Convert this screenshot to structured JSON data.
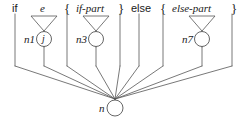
{
  "figure": {
    "kind": "syntax-tree-diagram",
    "stroke_color": "#555555",
    "text_color": "#1a1a1a",
    "background": "#ffffff"
  },
  "top_labels": [
    {
      "id": "if-keyword",
      "text": "if",
      "style": "roman",
      "x": 12,
      "y": 3
    },
    {
      "id": "e-nonterminal",
      "text": "e",
      "style": "italic",
      "x": 40,
      "y": 3
    },
    {
      "id": "brace-open-1",
      "text": "{",
      "style": "roman",
      "x": 64,
      "y": 2
    },
    {
      "id": "if-part",
      "text": "if-part",
      "style": "italic",
      "x": 76,
      "y": 3
    },
    {
      "id": "brace-close-1",
      "text": "}",
      "style": "roman",
      "x": 118,
      "y": 2
    },
    {
      "id": "else-keyword",
      "text": "else",
      "style": "roman",
      "x": 131,
      "y": 3
    },
    {
      "id": "brace-open-2",
      "text": "{",
      "style": "roman",
      "x": 160,
      "y": 2
    },
    {
      "id": "else-part",
      "text": "else-part",
      "style": "italic",
      "x": 172,
      "y": 3
    },
    {
      "id": "brace-close-2",
      "text": "}",
      "style": "roman",
      "x": 231,
      "y": 2
    }
  ],
  "triangles": [
    {
      "id": "triangle-e",
      "cx": 44,
      "top": 16,
      "half_width": 13,
      "apex_y": 31
    },
    {
      "id": "triangle-if-part",
      "cx": 96,
      "top": 16,
      "half_width": 13,
      "apex_y": 31
    },
    {
      "id": "triangle-else-part",
      "cx": 202,
      "top": 16,
      "half_width": 13,
      "apex_y": 31
    }
  ],
  "nodes": [
    {
      "id": "n1",
      "label": "n1",
      "inner": "j",
      "cx": 44,
      "cy": 39,
      "r": 7.5,
      "label_x": 24,
      "label_y": 34
    },
    {
      "id": "n3",
      "label": "n3",
      "inner": "",
      "cx": 96,
      "cy": 39,
      "r": 7.5,
      "label_x": 76,
      "label_y": 34
    },
    {
      "id": "n7",
      "label": "n7",
      "inner": "",
      "cx": 202,
      "cy": 39,
      "r": 7.5,
      "label_x": 182,
      "label_y": 34
    },
    {
      "id": "n",
      "label": "n",
      "inner": "",
      "cx": 115,
      "cy": 108,
      "r": 8,
      "label_x": 99,
      "label_y": 103
    }
  ],
  "junction": {
    "id": "merge-point",
    "x": 115,
    "y": 99
  },
  "vertical_drops": [
    {
      "id": "drop-if",
      "x": 15,
      "from": 14,
      "to": 66
    },
    {
      "id": "drop-e",
      "x": 44,
      "from": 47,
      "to": 66
    },
    {
      "id": "drop-brace-1",
      "x": 67,
      "from": 14,
      "to": 66
    },
    {
      "id": "drop-if-part",
      "x": 96,
      "from": 47,
      "to": 66
    },
    {
      "id": "drop-brace-2",
      "x": 120,
      "from": 14,
      "to": 66
    },
    {
      "id": "drop-else",
      "x": 139,
      "from": 14,
      "to": 66
    },
    {
      "id": "drop-brace-3",
      "x": 163,
      "from": 14,
      "to": 66
    },
    {
      "id": "drop-else-part",
      "x": 202,
      "from": 47,
      "to": 66
    },
    {
      "id": "drop-brace-4",
      "x": 232,
      "from": 14,
      "to": 66
    }
  ],
  "stems": [
    {
      "id": "stem-n1",
      "x": 44,
      "from": 31,
      "to": 47
    },
    {
      "id": "stem-n3",
      "x": 96,
      "from": 31,
      "to": 47
    },
    {
      "id": "stem-n7",
      "x": 202,
      "from": 31,
      "to": 47
    },
    {
      "id": "stem-n",
      "x": 115,
      "from": 99,
      "to": 100
    }
  ],
  "caption": ""
}
